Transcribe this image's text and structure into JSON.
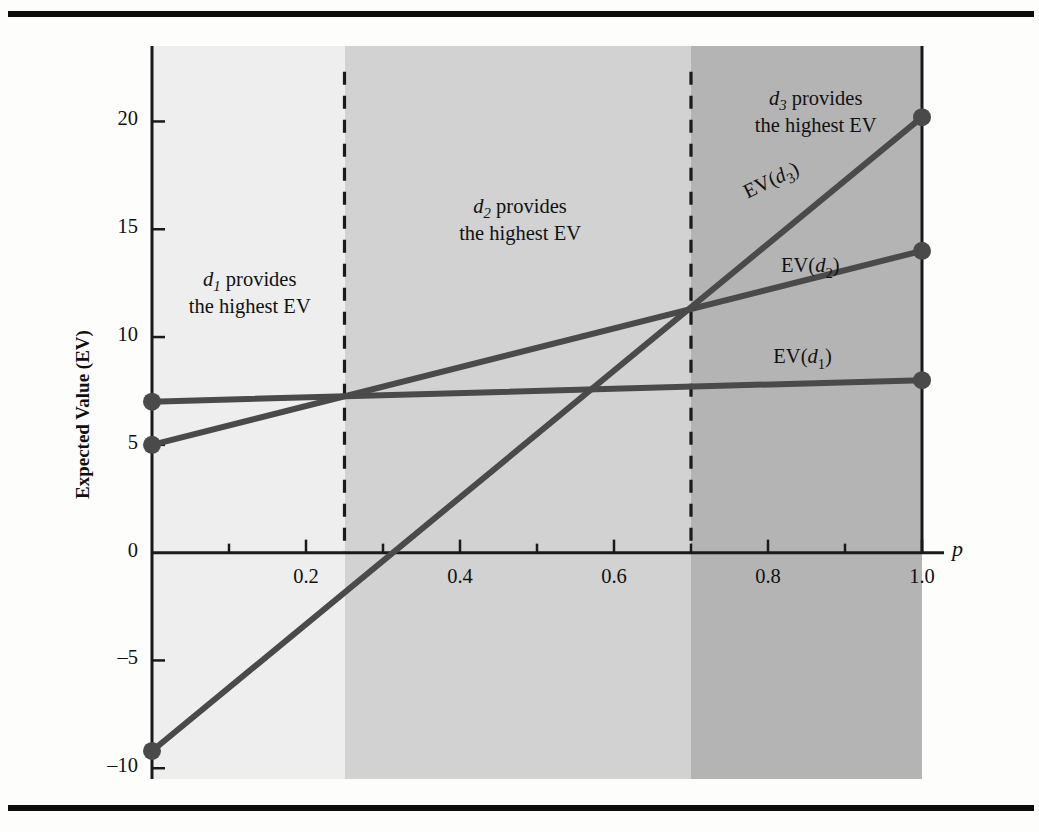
{
  "figure": {
    "background_color": "#fdfdfc",
    "rule_color": "#0d0d0d"
  },
  "axes": {
    "x_axis_name": "p",
    "y_axis_label": "Expected Value (EV)",
    "x_tick_labels": [
      "0.2",
      "0.4",
      "0.6",
      "0.8",
      "1.0"
    ],
    "y_tick_labels": [
      "20",
      "15",
      "10",
      "5",
      "0",
      "–5",
      "–10"
    ]
  },
  "regions": [
    {
      "name": "region-d1",
      "line1_prefix": "d",
      "line1_sub": "1",
      "line1_rest": " provides",
      "line2": "the highest EV",
      "fill": "#eeeeee"
    },
    {
      "name": "region-d2",
      "line1_prefix": "d",
      "line1_sub": "2",
      "line1_rest": " provides",
      "line2": "the highest EV",
      "fill": "#d2d2d2"
    },
    {
      "name": "region-d3",
      "line1_prefix": "d",
      "line1_sub": "3",
      "line1_rest": " provides",
      "line2": "the highest EV",
      "fill": "#b4b4b4"
    }
  ],
  "curve_labels": [
    {
      "name": "label-ev-d3",
      "prefix": "EV(",
      "ital": "d",
      "sub": "3",
      "suffix": ")"
    },
    {
      "name": "label-ev-d2",
      "prefix": "EV(",
      "ital": "d",
      "sub": "2",
      "suffix": ")"
    },
    {
      "name": "label-ev-d1",
      "prefix": "EV(",
      "ital": "d",
      "sub": "1",
      "suffix": ")"
    }
  ],
  "chart_data": {
    "type": "line",
    "title": "",
    "xlabel": "p",
    "ylabel": "Expected Value (EV)",
    "xlim": [
      0,
      1.0
    ],
    "ylim": [
      -10.5,
      23.5
    ],
    "grid": false,
    "legend_position": "inline-right",
    "x_ticks": [
      0.2,
      0.4,
      0.6,
      0.8,
      1.0
    ],
    "x_minor_ticks": [
      0.1,
      0.3,
      0.5,
      0.7,
      0.9
    ],
    "y_ticks": [
      -10,
      -5,
      0,
      5,
      10,
      15,
      20
    ],
    "x": [
      0,
      1.0
    ],
    "series": [
      {
        "name": "EV(d1)",
        "values": [
          7.0,
          8.0
        ],
        "color": "#4a4a4a",
        "endpoint_markers": true
      },
      {
        "name": "EV(d2)",
        "values": [
          5.0,
          14.0
        ],
        "color": "#4a4a4a",
        "endpoint_markers": true
      },
      {
        "name": "EV(d3)",
        "values": [
          -9.2,
          20.2
        ],
        "color": "#4a4a4a",
        "endpoint_markers": true
      }
    ],
    "annotations": [
      {
        "text": "d1 provides the highest EV",
        "x_range": [
          0,
          0.25
        ]
      },
      {
        "text": "d2 provides the highest EV",
        "x_range": [
          0.25,
          0.7
        ]
      },
      {
        "text": "d3 provides the highest EV",
        "x_range": [
          0.7,
          1.0
        ]
      }
    ],
    "vertical_dividers": [
      0.25,
      0.7
    ],
    "region_fills": [
      "#eeeeee",
      "#d2d2d2",
      "#b4b4b4"
    ]
  }
}
